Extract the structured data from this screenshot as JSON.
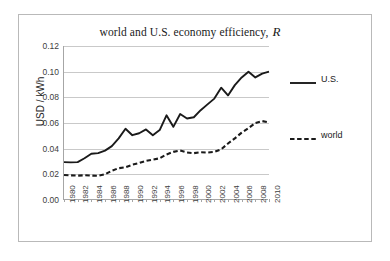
{
  "chart_data": {
    "type": "line",
    "title_main": "world and U.S. economy efficiency,",
    "title_symbol": "R",
    "xlabel": "",
    "ylabel": "USD / kWh",
    "ylim": [
      0.0,
      0.12
    ],
    "xlim": [
      1980,
      2010
    ],
    "grid": true,
    "legend_position": "right",
    "ytick_labels": [
      "0.12",
      "0.10",
      "0.08",
      "0.06",
      "0.04",
      "0.02",
      "0.00"
    ],
    "ytick_values": [
      0.12,
      0.1,
      0.08,
      0.06,
      0.04,
      0.02,
      0.0
    ],
    "xtick_labels": [
      "1980",
      "1982",
      "1984",
      "1986",
      "1988",
      "1990",
      "1992",
      "1994",
      "1996",
      "1998",
      "2000",
      "2002",
      "2004",
      "2006",
      "2008",
      "2010"
    ],
    "xtick_values": [
      1980,
      1982,
      1984,
      1986,
      1988,
      1990,
      1992,
      1994,
      1996,
      1998,
      2000,
      2002,
      2004,
      2006,
      2008,
      2010
    ],
    "x": [
      1980,
      1981,
      1982,
      1983,
      1984,
      1985,
      1986,
      1987,
      1988,
      1989,
      1990,
      1991,
      1992,
      1993,
      1994,
      1995,
      1996,
      1997,
      1998,
      1999,
      2000,
      2001,
      2002,
      2003,
      2004,
      2005,
      2006,
      2007,
      2008,
      2009,
      2010
    ],
    "series": [
      {
        "name": "U.S.",
        "style": "solid",
        "color": "#1a1a1a",
        "values": [
          0.0295,
          0.0293,
          0.0295,
          0.0325,
          0.036,
          0.0365,
          0.0385,
          0.042,
          0.048,
          0.0555,
          0.0505,
          0.052,
          0.055,
          0.0505,
          0.0545,
          0.066,
          0.057,
          0.067,
          0.0635,
          0.0645,
          0.07,
          0.0745,
          0.079,
          0.0875,
          0.0815,
          0.0895,
          0.0955,
          0.1,
          0.0955,
          0.0985,
          0.1
        ]
      },
      {
        "name": "world",
        "style": "dashed",
        "color": "#1a1a1a",
        "values": [
          0.0195,
          0.0192,
          0.019,
          0.0193,
          0.019,
          0.0188,
          0.02,
          0.0228,
          0.0248,
          0.0255,
          0.0275,
          0.0288,
          0.0305,
          0.0315,
          0.0325,
          0.0355,
          0.0375,
          0.0385,
          0.037,
          0.0365,
          0.0372,
          0.037,
          0.0375,
          0.0395,
          0.044,
          0.048,
          0.0525,
          0.056,
          0.06,
          0.0615,
          0.0605
        ]
      }
    ]
  },
  "legend": {
    "entries": [
      {
        "label": "U.S.",
        "style": "solid"
      },
      {
        "label": "world",
        "style": "dashed"
      }
    ]
  }
}
